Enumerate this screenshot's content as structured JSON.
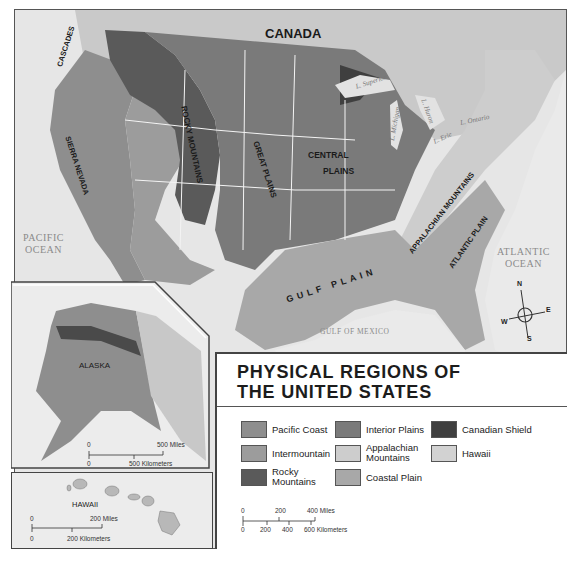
{
  "map": {
    "title_line1": "PHYSICAL REGIONS OF",
    "title_line2": "THE UNITED STATES",
    "country_label": "CANADA",
    "region_labels": {
      "cascades": "CASCADES",
      "sierra_nevada": "SIERRA NEVADA",
      "rocky_mountains": "ROCKY MOUNTAINS",
      "great_plains": "GREAT PLAINS",
      "central_plains_1": "CENTRAL",
      "central_plains_2": "PLAINS",
      "appalachian_mountains": "APPALACHIAN MOUNTAINS",
      "atlantic_plain": "ATLANTIC PLAIN",
      "gulf_plain": "GULF PLAIN"
    },
    "water_labels": {
      "pacific_1": "PACIFIC",
      "pacific_2": "OCEAN",
      "atlantic_1": "ATLANTIC",
      "atlantic_2": "OCEAN",
      "gulf": "GULF OF MEXICO",
      "lake_superior": "L. Superior",
      "lake_michigan": "L. Michigan",
      "lake_huron": "L. Huron",
      "lake_ontario": "L. Ontario",
      "lake_erie": "L. Erie"
    },
    "compass": {
      "n": "N",
      "s": "S",
      "e": "E",
      "w": "W"
    }
  },
  "legend": {
    "items": [
      {
        "label": "Pacific Coast",
        "color": "#8e8e8e"
      },
      {
        "label": "Intermountain",
        "color": "#9c9c9c"
      },
      {
        "label": "Rocky Mountains",
        "color": "#5a5a5a"
      },
      {
        "label": "Interior Plains",
        "color": "#7a7a7a"
      },
      {
        "label": "Appalachian Mountains",
        "color": "#cdcdcd"
      },
      {
        "label": "Coastal Plain",
        "color": "#a8a8a8"
      },
      {
        "label": "Canadian Shield",
        "color": "#3f3f3f"
      },
      {
        "label": "Hawaii",
        "color": "#d2d2d2"
      }
    ],
    "scale": {
      "miles": [
        "0",
        "200",
        "400 Miles"
      ],
      "kilometers": [
        "0",
        "200",
        "400",
        "600 Kilometers"
      ]
    }
  },
  "alaska": {
    "label": "ALASKA",
    "scale_miles": [
      "0",
      "500 Miles"
    ],
    "scale_km": [
      "0",
      "500 Kilometers"
    ]
  },
  "hawaii": {
    "label": "HAWAII",
    "scale_miles": [
      "0",
      "200 Miles"
    ],
    "scale_km": [
      "0",
      "200 Kilometers"
    ]
  }
}
